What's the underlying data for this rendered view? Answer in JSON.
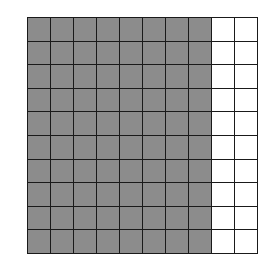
{
  "grid": {
    "rows": 10,
    "cols": 10,
    "shaded_columns": 8,
    "shaded_cells": 80,
    "total_cells": 100,
    "colors": {
      "shaded": "#8c8c8c",
      "empty": "#ffffff",
      "line": "#1a1a1a"
    }
  }
}
